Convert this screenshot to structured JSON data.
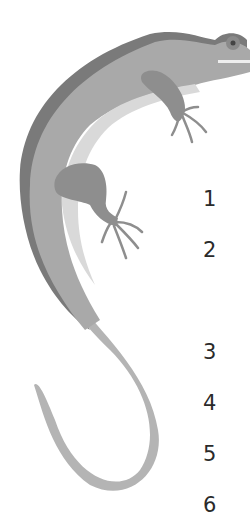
{
  "illustration": {
    "subject": "lizard",
    "icon": "lizard-illustration",
    "colors": {
      "back_stripe": "#7a7a7a",
      "body": "#a9a9a9",
      "belly": "#d9d9d9",
      "limbs": "#8e8e8e",
      "tail": "#b4b4b4",
      "eye": "#555555",
      "background": "#ffffff"
    }
  },
  "list": {
    "numbers": [
      "1",
      "2",
      "3",
      "4",
      "5",
      "6"
    ]
  }
}
